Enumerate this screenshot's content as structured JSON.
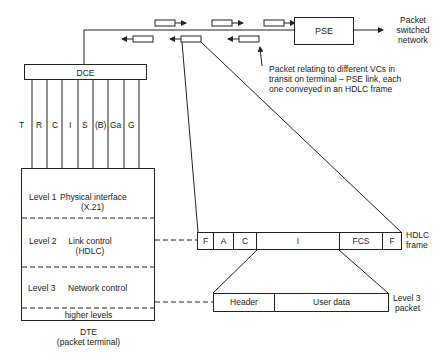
{
  "network": {
    "pse_label": "PSE",
    "network_label_line1": "Packet",
    "network_label_line2": "switched",
    "network_label_line3": "network",
    "annotation_line1": "Packet relating to different VCs in",
    "annotation_line2": "transit on terminal – PSE link, each",
    "annotation_line3": "one conveyed in an HDLC frame"
  },
  "dce": {
    "label": "DCE",
    "circuits": [
      "T",
      "R",
      "C",
      "I",
      "S",
      "(B)",
      "Ga",
      "G"
    ]
  },
  "dte": {
    "levels": [
      {
        "name": "Level 1",
        "desc_line1": "Physical interface",
        "desc_line2": "(X.21)"
      },
      {
        "name": "Level 2",
        "desc_line1": "Link control",
        "desc_line2": "(HDLC)"
      },
      {
        "name": "Level 3",
        "desc_line1": "Network control",
        "desc_line2": ""
      }
    ],
    "higher_levels": "higher levels",
    "caption_line1": "DTE",
    "caption_line2": "(packet terminal)"
  },
  "hdlc_frame": {
    "fields": [
      "F",
      "A",
      "C",
      "I",
      "FCS",
      "F"
    ],
    "label_line1": "HDLC",
    "label_line2": "frame"
  },
  "level3_packet": {
    "fields": [
      "Header",
      "User data"
    ],
    "label_line1": "Level 3",
    "label_line2": "packet"
  }
}
